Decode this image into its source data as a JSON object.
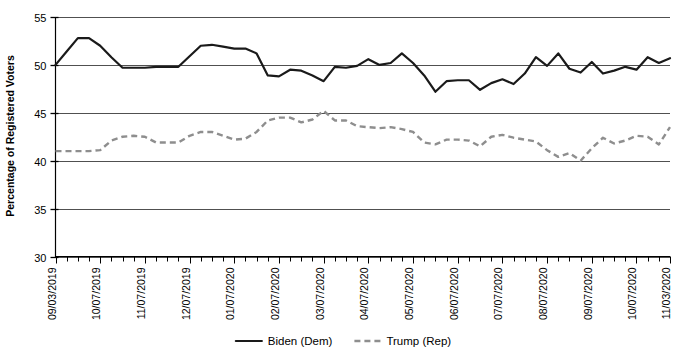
{
  "top_faint_text": "",
  "chart_data": {
    "type": "line",
    "title": "",
    "xlabel": "",
    "ylabel": "Percentage of Registered Voters",
    "ylim": [
      30,
      55
    ],
    "yticks": [
      30,
      35,
      40,
      45,
      50,
      55
    ],
    "grid": true,
    "legend_position": "bottom",
    "tick_labels": [
      "09/03/2019",
      "10/07/2019",
      "11/07/2019",
      "12/07/2019",
      "01/07/2020",
      "02/07/2020",
      "03/07/2020",
      "04/07/2020",
      "05/07/2020",
      "06/07/2020",
      "07/07/2020",
      "08/07/2020",
      "09/07/2020",
      "10/07/2020",
      "11/03/2020"
    ],
    "tick_label_indices": [
      0,
      4,
      8,
      12,
      16,
      20,
      24,
      28,
      32,
      36,
      40,
      44,
      48,
      52,
      55
    ],
    "n_points": 56,
    "series": [
      {
        "name": "Biden (Dem)",
        "color": "#1a1a1a",
        "style": "solid",
        "values": [
          50.0,
          51.4,
          52.8,
          52.8,
          52.0,
          50.8,
          49.7,
          49.7,
          49.7,
          49.8,
          49.8,
          49.8,
          50.9,
          52.0,
          52.1,
          51.9,
          51.7,
          51.7,
          51.2,
          48.9,
          48.8,
          49.5,
          49.4,
          48.9,
          48.3,
          49.8,
          49.7,
          49.9,
          50.6,
          50.0,
          50.2,
          51.2,
          50.2,
          48.9,
          47.2,
          48.3,
          48.4,
          48.4,
          47.4,
          48.1,
          48.5,
          48.0,
          49.1,
          50.8,
          49.9,
          51.2,
          49.6,
          49.2,
          50.3,
          49.1,
          49.4,
          49.8,
          49.5,
          50.8,
          50.2,
          50.7
        ]
      },
      {
        "name": "Trump (Rep)",
        "color": "#8e8e8e",
        "style": "dashed",
        "values": [
          41.0,
          41.0,
          41.0,
          41.0,
          41.1,
          42.1,
          42.5,
          42.6,
          42.5,
          41.9,
          41.9,
          41.9,
          42.6,
          43.0,
          43.0,
          42.6,
          42.2,
          42.3,
          43.0,
          44.2,
          44.5,
          44.5,
          44.0,
          44.3,
          45.2,
          44.2,
          44.2,
          43.6,
          43.5,
          43.4,
          43.5,
          43.3,
          43.0,
          41.9,
          41.7,
          42.2,
          42.2,
          42.1,
          41.5,
          42.5,
          42.7,
          42.4,
          42.2,
          42.0,
          41.1,
          40.4,
          40.8,
          40.0,
          41.3,
          42.4,
          41.8,
          42.1,
          42.6,
          42.5,
          41.7,
          43.5
        ]
      }
    ]
  },
  "legend": {
    "items": [
      {
        "label": "Biden (Dem)",
        "style": "solid",
        "color": "#1a1a1a"
      },
      {
        "label": "Trump (Rep)",
        "style": "dashed",
        "color": "#8e8e8e"
      }
    ]
  }
}
